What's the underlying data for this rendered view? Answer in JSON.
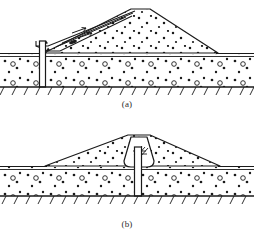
{
  "figure": {
    "stroke_color": "#1a1a1a",
    "fill_color": "#ffffff",
    "panels": [
      {
        "id": "a",
        "caption": "(a)",
        "description": "Embankment dam with upstream impervious blanket/membrane and vertical cutoff wall through pervious foundation to bedrock",
        "elements": [
          "dam-embankment",
          "upstream-impervious-blanket",
          "cutoff-wall",
          "pervious-foundation",
          "bedrock-line",
          "ground-surface-line",
          "seepage-arrows"
        ]
      },
      {
        "id": "b",
        "caption": "(b)",
        "description": "Embankment dam with central impervious core and vertical cutoff wall extending to bedrock",
        "elements": [
          "dam-embankment",
          "central-impervious-core",
          "cutoff-wall",
          "pervious-foundation",
          "bedrock-line",
          "ground-surface-line"
        ]
      }
    ]
  }
}
